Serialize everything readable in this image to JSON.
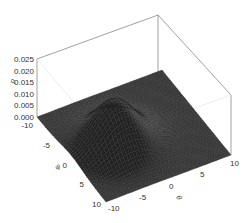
{
  "chart_data": {
    "type": "surface3d",
    "title": "",
    "x_axis": {
      "label": "φ",
      "range": [
        -10,
        10
      ],
      "ticks": [
        "-10",
        "-5",
        "0",
        "5",
        "10"
      ]
    },
    "y_axis": {
      "label": "θ",
      "range": [
        -10,
        10
      ],
      "ticks": [
        "-10",
        "-5",
        "0",
        "5",
        "10"
      ]
    },
    "z_axis": {
      "label": "p",
      "range": [
        0,
        0.025
      ],
      "ticks": [
        "0.000",
        "0.005",
        "0.010",
        "0.015",
        "0.020",
        "0.025"
      ]
    },
    "peak": {
      "x": 0,
      "y": -3,
      "z": 0.018
    },
    "sigma": 3.2,
    "grid_resolution": 40,
    "surface_color": "#3a3a3a",
    "mesh_color": "#1c1c1c",
    "box_color": "#888888"
  }
}
